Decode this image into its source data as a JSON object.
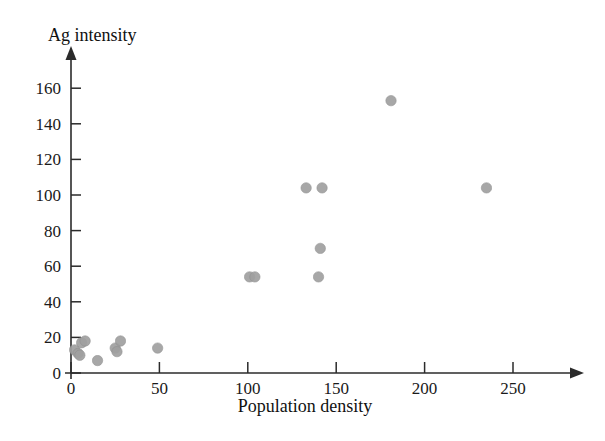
{
  "figure": {
    "faint_top_mark": "",
    "background_color": "#ffffff",
    "point_color": "#a0a0a0",
    "axis_color": "#2b2b2b"
  },
  "chart_data": {
    "type": "scatter",
    "title": "",
    "xlabel": "Population density",
    "ylabel": "Ag intensity",
    "xlim": [
      0,
      280
    ],
    "ylim": [
      0,
      175
    ],
    "grid": false,
    "legend": null,
    "x_ticks": [
      0,
      50,
      100,
      150,
      200,
      250
    ],
    "x_tick_labels": [
      "0",
      "50",
      "100",
      "150",
      "200",
      "250"
    ],
    "y_ticks": [
      0,
      20,
      40,
      60,
      80,
      100,
      120,
      140,
      160
    ],
    "y_tick_labels": [
      "0",
      "20",
      "40",
      "60",
      "80",
      "100",
      "120",
      "140",
      "160"
    ],
    "series": [
      {
        "name": "observations",
        "marker": "circle",
        "color": "#a0a0a0",
        "points": [
          {
            "x": 2,
            "y": 13
          },
          {
            "x": 4,
            "y": 11
          },
          {
            "x": 5,
            "y": 10
          },
          {
            "x": 6,
            "y": 17
          },
          {
            "x": 8,
            "y": 18
          },
          {
            "x": 15,
            "y": 7
          },
          {
            "x": 25,
            "y": 14
          },
          {
            "x": 26,
            "y": 12
          },
          {
            "x": 28,
            "y": 18
          },
          {
            "x": 49,
            "y": 14
          },
          {
            "x": 101,
            "y": 54
          },
          {
            "x": 104,
            "y": 54
          },
          {
            "x": 133,
            "y": 104
          },
          {
            "x": 142,
            "y": 104
          },
          {
            "x": 141,
            "y": 70
          },
          {
            "x": 140,
            "y": 54
          },
          {
            "x": 181,
            "y": 153
          },
          {
            "x": 235,
            "y": 104
          }
        ]
      }
    ]
  }
}
